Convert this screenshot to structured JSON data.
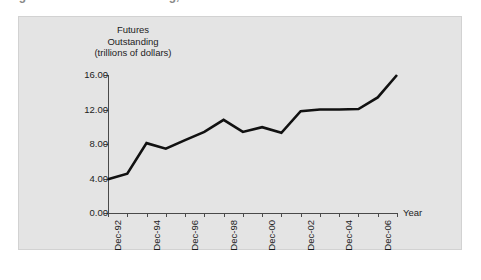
{
  "figure": {
    "cropped_title": "Figure 1   Futures Outstanding, 1992-2007",
    "panel_background": "#e4e4e4",
    "line_color": "#111111",
    "axis_color": "#4a4a4a",
    "text_color": "#1c1c1c"
  },
  "chart_data": {
    "type": "line",
    "title": "",
    "ylabel_lines": [
      "Futures",
      "Outstanding",
      "(trillions of dollars)"
    ],
    "ylabel": "Futures Outstanding (trillions of dollars)",
    "xlabel": "Year",
    "ylim": [
      0.0,
      16.0
    ],
    "ytick_labels": [
      "0.00",
      "4.00",
      "8.00",
      "12.00",
      "16.00"
    ],
    "ytick_values": [
      0.0,
      4.0,
      8.0,
      12.0,
      16.0
    ],
    "grid": false,
    "legend": false,
    "x": [
      "Dec-92",
      "Dec-93",
      "Dec-94",
      "Dec-95",
      "Dec-96",
      "Dec-97",
      "Dec-98",
      "Dec-99",
      "Dec-00",
      "Dec-01",
      "Dec-02",
      "Dec-03",
      "Dec-04",
      "Dec-05",
      "Dec-06",
      "Dec-07"
    ],
    "xtick_labels": [
      "Dec-92",
      "",
      "Dec-94",
      "",
      "Dec-96",
      "",
      "Dec-98",
      "",
      "Dec-00",
      "",
      "Dec-02",
      "",
      "Dec-04",
      "",
      "Dec-06",
      ""
    ],
    "values": [
      3.9,
      4.55,
      8.1,
      7.45,
      8.45,
      9.4,
      10.8,
      9.4,
      9.95,
      9.3,
      11.8,
      12.0,
      12.0,
      12.05,
      13.4,
      16.0
    ],
    "units": "trillions of dollars"
  }
}
